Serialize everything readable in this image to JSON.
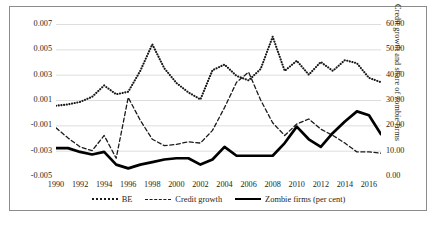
{
  "chart_data": {
    "type": "line",
    "title": "",
    "xlabel": "",
    "ylabel": "Borrowing exuberance",
    "ylabel_right": "Credit growth and share of zombie firms",
    "grid": true,
    "legend_position": "bottom",
    "x": [
      1990,
      1991,
      1992,
      1993,
      1994,
      1995,
      1996,
      1997,
      1998,
      1999,
      2000,
      2001,
      2002,
      2003,
      2004,
      2005,
      2006,
      2007,
      2008,
      2009,
      2010,
      2011,
      2012,
      2013,
      2014,
      2015,
      2016,
      2017
    ],
    "xticks": [
      "1990",
      "1992",
      "1994",
      "1996",
      "1998",
      "2000",
      "2002",
      "2004",
      "2006",
      "2008",
      "2010",
      "2012",
      "2014",
      "2016"
    ],
    "yticks_left": [
      "0.007",
      "0.005",
      "0.003",
      "0.001",
      "-0.001",
      "-0.003",
      "-0.005"
    ],
    "yticks_right": [
      "60.00",
      "50.00",
      "40.00",
      "30.00",
      "20.00",
      "10.00",
      "0.00"
    ],
    "ylim_left": [
      -0.005,
      0.007
    ],
    "ylim_right": [
      0.0,
      60.0
    ],
    "series": [
      {
        "name": "BE",
        "axis": "left",
        "style": "dotted",
        "color": "#1a1a1a",
        "values": [
          0.00055,
          0.00065,
          0.00085,
          0.00125,
          0.00215,
          0.00145,
          0.00165,
          0.0033,
          0.0054,
          0.0035,
          0.00235,
          0.0016,
          0.00105,
          0.00335,
          0.0038,
          0.0029,
          0.00255,
          0.00345,
          0.006,
          0.0033,
          0.0041,
          0.003,
          0.004,
          0.0033,
          0.00415,
          0.0039,
          0.00275,
          0.0024
        ]
      },
      {
        "name": "Credit growth",
        "axis": "right",
        "style": "dashed",
        "color": "#1a1a1a",
        "values": [
          19.0,
          15.0,
          11.5,
          10.0,
          16.0,
          7.0,
          31.0,
          22.0,
          14.5,
          12.0,
          12.5,
          13.5,
          13.0,
          18.0,
          27.0,
          37.0,
          41.0,
          30.0,
          21.0,
          16.0,
          20.5,
          22.5,
          18.5,
          16.0,
          13.0,
          9.5,
          9.5,
          9.0
        ]
      },
      {
        "name": "Zombie firms (per cent)",
        "axis": "right",
        "style": "solid",
        "color": "#000000",
        "values": [
          11.0,
          11.0,
          9.5,
          8.5,
          9.5,
          4.5,
          3.0,
          4.5,
          5.5,
          6.5,
          7.0,
          7.0,
          4.5,
          6.5,
          11.5,
          8.0,
          8.0,
          8.0,
          8.0,
          13.0,
          19.5,
          14.5,
          11.5,
          17.0,
          21.5,
          25.5,
          24.0,
          16.5
        ]
      }
    ]
  },
  "legend": {
    "items": [
      {
        "label": "BE",
        "style": "dotted"
      },
      {
        "label": "Credit growth",
        "style": "dashed"
      },
      {
        "label": "Zombie firms (per cent)",
        "style": "solid"
      }
    ]
  }
}
